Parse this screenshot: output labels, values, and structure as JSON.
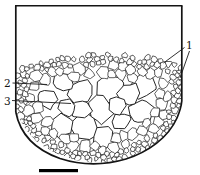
{
  "figure": {
    "type": "grain-macrostructure-cross-section",
    "labels": [
      {
        "text": "1"
      },
      {
        "text": "2"
      },
      {
        "text": "3"
      }
    ],
    "colors": {
      "background": "#ffffff",
      "line": "#1a1a1a",
      "bar": "#000000"
    }
  }
}
